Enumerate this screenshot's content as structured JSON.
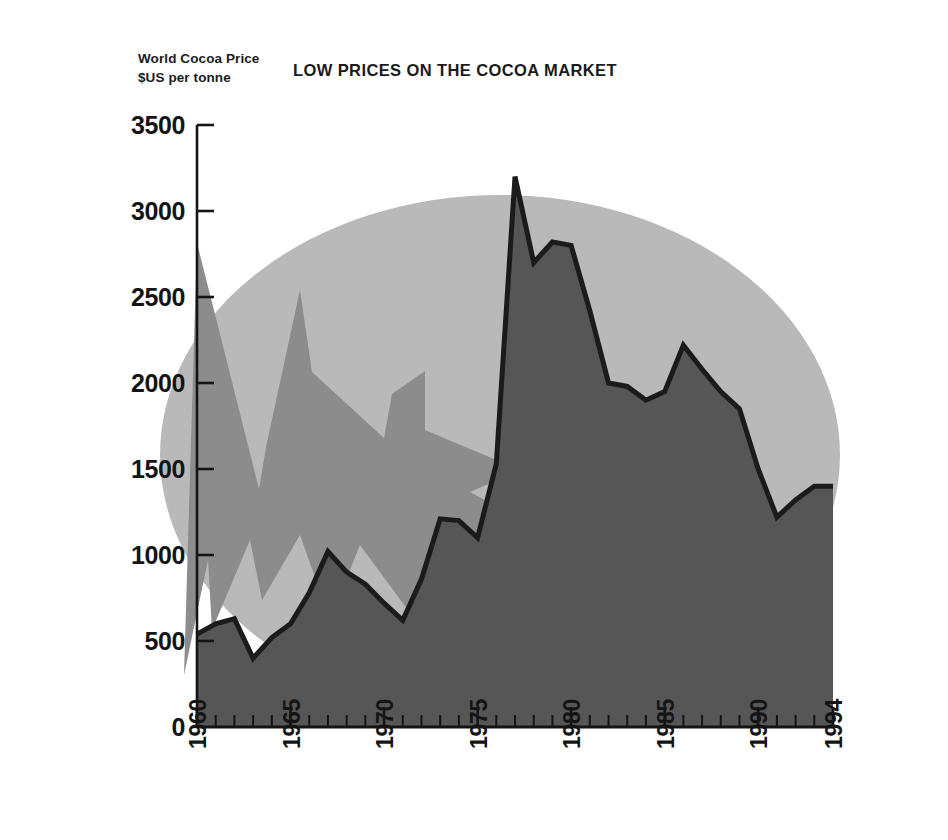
{
  "figure": {
    "title": "LOW PRICES ON THE COCOA MARKET",
    "axis_title_line1": "World Cocoa Price",
    "axis_title_line2": "$US per tonne"
  },
  "colors": {
    "background": "#ffffff",
    "ellipse_backdrop": "#b9b9b9",
    "arrow_graphic": "#8c8c8c",
    "area_fill": "#565656",
    "series_line": "#1b1b1b",
    "axis": "#141414",
    "text": "#141414"
  },
  "chart_data": {
    "type": "area",
    "title": "LOW PRICES ON THE COCOA MARKET",
    "xlabel": "",
    "ylabel": "World Cocoa Price $US per tonne",
    "ylim": [
      0,
      3500
    ],
    "xlim": [
      1960,
      1994
    ],
    "ytick_labels": [
      "0",
      "500",
      "1000",
      "1500",
      "2000",
      "2500",
      "3000",
      "3500"
    ],
    "ytick_values": [
      0,
      500,
      1000,
      1500,
      2000,
      2500,
      3000,
      3500
    ],
    "xtick_labels": [
      "1960",
      "1965",
      "1970",
      "1975",
      "1980",
      "1985",
      "1990",
      "1994"
    ],
    "xtick_values": [
      1960,
      1965,
      1970,
      1975,
      1980,
      1985,
      1990,
      1994
    ],
    "xtick_rotation": -90,
    "grid": false,
    "legend": "none",
    "series": [
      {
        "name": "World Cocoa Price",
        "unit": "$US per tonne",
        "x": [
          1960,
          1961,
          1962,
          1963,
          1964,
          1965,
          1966,
          1967,
          1968,
          1969,
          1970,
          1971,
          1972,
          1973,
          1974,
          1975,
          1976,
          1977,
          1978,
          1979,
          1980,
          1981,
          1982,
          1983,
          1984,
          1985,
          1986,
          1987,
          1988,
          1989,
          1990,
          1991,
          1992,
          1993,
          1994
        ],
        "values": [
          540,
          600,
          630,
          400,
          520,
          600,
          780,
          1020,
          900,
          830,
          720,
          620,
          860,
          1210,
          1200,
          1100,
          1530,
          3200,
          2700,
          2820,
          2800,
          2420,
          2000,
          1980,
          1900,
          1950,
          2220,
          2080,
          1950,
          1850,
          1500,
          1220,
          1320,
          1400,
          1400
        ]
      }
    ]
  },
  "geometry": {
    "plot_left_px": 197,
    "plot_right_px": 833,
    "plot_baseline_px": 727,
    "plot_top_px": 125,
    "px_per_year": 18.7
  }
}
